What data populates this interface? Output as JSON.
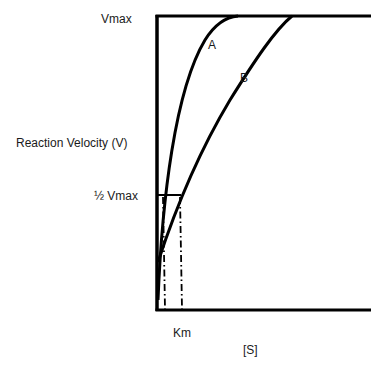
{
  "diagram": {
    "type": "michaelis-menten-comparison",
    "y_axis_label": "Reaction Velocity (V)",
    "x_axis_label": "[S]",
    "vmax_label": "Vmax",
    "half_vmax_label": "½ Vmax",
    "km_label": "Km",
    "curves": [
      {
        "name": "A",
        "label": "A"
      },
      {
        "name": "B",
        "label": "B"
      }
    ],
    "line_color": "#000000"
  }
}
